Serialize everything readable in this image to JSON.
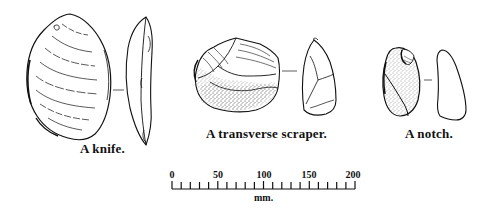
{
  "figure": {
    "artifacts": [
      {
        "id": "knife",
        "caption": "A knife.",
        "views": [
          "dorsal-face",
          "side-profile"
        ]
      },
      {
        "id": "transverse-scraper",
        "caption": "A transverse scraper.",
        "views": [
          "dorsal-face",
          "side-profile"
        ]
      },
      {
        "id": "notch",
        "caption": "A notch.",
        "views": [
          "dorsal-face",
          "side-profile"
        ]
      }
    ],
    "scale_bar": {
      "labels": [
        "0",
        "50",
        "100",
        "150",
        "200"
      ],
      "min": 0,
      "max": 200,
      "major_step": 50,
      "minor_step": 10,
      "unit": "mm."
    },
    "colors": {
      "ink": "#111111",
      "paper": "#ffffff"
    }
  }
}
